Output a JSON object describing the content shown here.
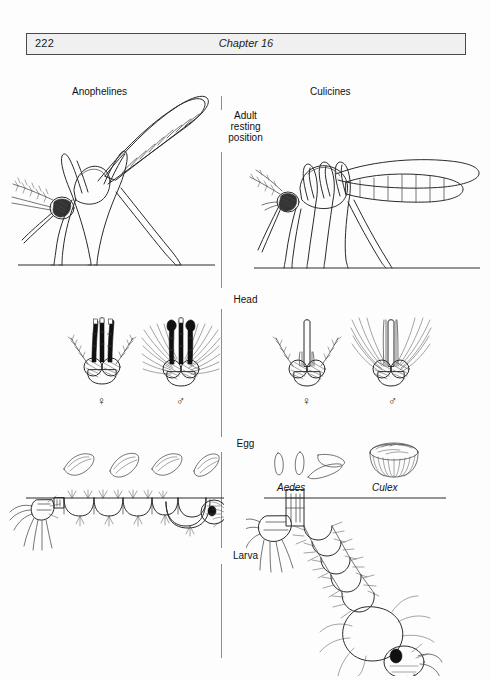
{
  "header": {
    "page_number": "222",
    "chapter_title": "Chapter 16"
  },
  "figure": {
    "columns": {
      "left_label": "Anophelines",
      "right_label": "Culicines"
    },
    "stages": [
      {
        "id": "adult",
        "label": "Adult\nresting\nposition",
        "line1": "Adult",
        "line2": "resting",
        "line3": "position"
      },
      {
        "id": "head",
        "label": "Head"
      },
      {
        "id": "egg",
        "label": "Egg"
      },
      {
        "id": "larva",
        "label": "Larva"
      }
    ],
    "head_row": {
      "anopheline_female_symbol": "♀",
      "anopheline_male_symbol": "♂",
      "culicine_female_symbol": "♀",
      "culicine_male_symbol": "♂"
    },
    "egg_row": {
      "culicine_genus_1": "Aedes",
      "culicine_genus_2": "Culex"
    }
  },
  "colors": {
    "ink": "#2a2a2a",
    "header_fill": "#f0f0f0",
    "header_border": "#4a4a4a",
    "paper": "#fdfdfd",
    "divider": "#8d8d8d"
  }
}
